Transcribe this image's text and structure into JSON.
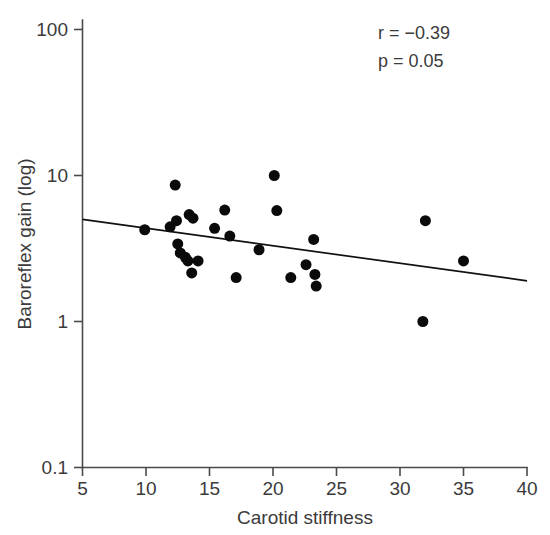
{
  "chart_data": {
    "type": "scatter",
    "title": "",
    "xlabel": "Carotid stiffness",
    "ylabel": "Baroreflex gain (log)",
    "xlim": [
      5,
      40
    ],
    "ylim": [
      0.1,
      100
    ],
    "yscale": "log",
    "xscale": "linear",
    "grid": false,
    "legend": null,
    "xticks": [
      5,
      10,
      15,
      20,
      25,
      30,
      35,
      40
    ],
    "xtick_labels": [
      "5",
      "10",
      "15",
      "20",
      "25",
      "30",
      "35",
      "40"
    ],
    "yticks": [
      0.1,
      1,
      10,
      100
    ],
    "ytick_labels": [
      "0.1",
      "1",
      "10",
      "100"
    ],
    "marker": {
      "shape": "circle",
      "color": "#0a0a0a",
      "size_px": 11
    },
    "points": [
      {
        "x": 9.9,
        "y": 4.25
      },
      {
        "x": 11.9,
        "y": 4.45
      },
      {
        "x": 12.3,
        "y": 8.6
      },
      {
        "x": 12.4,
        "y": 4.9
      },
      {
        "x": 12.5,
        "y": 3.4
      },
      {
        "x": 12.7,
        "y": 2.95
      },
      {
        "x": 13.1,
        "y": 2.75
      },
      {
        "x": 13.3,
        "y": 2.6
      },
      {
        "x": 13.4,
        "y": 5.4
      },
      {
        "x": 13.7,
        "y": 5.1
      },
      {
        "x": 13.6,
        "y": 2.15
      },
      {
        "x": 14.1,
        "y": 2.6
      },
      {
        "x": 15.4,
        "y": 4.35
      },
      {
        "x": 16.2,
        "y": 5.8
      },
      {
        "x": 16.6,
        "y": 3.85
      },
      {
        "x": 17.1,
        "y": 2.0
      },
      {
        "x": 18.9,
        "y": 3.1
      },
      {
        "x": 20.1,
        "y": 10.0
      },
      {
        "x": 20.3,
        "y": 5.75
      },
      {
        "x": 21.4,
        "y": 2.0
      },
      {
        "x": 22.6,
        "y": 2.45
      },
      {
        "x": 23.2,
        "y": 3.65
      },
      {
        "x": 23.3,
        "y": 2.1
      },
      {
        "x": 23.4,
        "y": 1.75
      },
      {
        "x": 31.8,
        "y": 1.0
      },
      {
        "x": 32.0,
        "y": 4.9
      },
      {
        "x": 35.0,
        "y": 2.6
      }
    ],
    "fit_line": {
      "x_start": 5,
      "y_start": 5.0,
      "x_end": 40,
      "y_end": 1.9,
      "color": "#111111"
    },
    "annotations": [
      {
        "name": "correlation",
        "text": "r = −0.39",
        "x": 30.5,
        "y": 55
      },
      {
        "name": "p-value",
        "text": "p = 0.05",
        "x": 30.5,
        "y": 38
      }
    ]
  },
  "stats": {
    "r_label": "r = −0.39",
    "p_label": "p = 0.05"
  },
  "axes": {
    "x_title": "Carotid stiffness",
    "y_title": "Baroreflex gain (log)",
    "x_tick_0": "5",
    "x_tick_1": "10",
    "x_tick_2": "15",
    "x_tick_3": "20",
    "x_tick_4": "25",
    "x_tick_5": "30",
    "x_tick_6": "35",
    "x_tick_7": "40",
    "y_tick_0": "100",
    "y_tick_1": "10",
    "y_tick_2": "1",
    "y_tick_3": "0.1"
  }
}
